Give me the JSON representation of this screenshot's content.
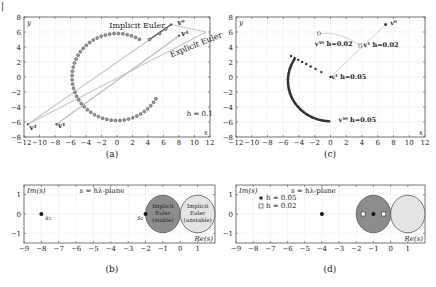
{
  "figure": {
    "corner_mark": "|",
    "captions": [
      "(a)",
      "(b)",
      "(c)",
      "(d)"
    ]
  },
  "chart_data": [
    {
      "id": "a",
      "type": "scatter",
      "title": "",
      "caption": "(a)",
      "xlabel": "x",
      "ylabel": "y",
      "xlim": [
        -12,
        12
      ],
      "ylim": [
        -8,
        8
      ],
      "xticks": [
        -12,
        -10,
        -8,
        -6,
        -4,
        -2,
        0,
        2,
        4,
        6,
        8,
        10,
        12
      ],
      "yticks": [
        -8,
        -6,
        -4,
        -2,
        0,
        2,
        4,
        6,
        8
      ],
      "grid": true,
      "annotations": [
        {
          "text": "Implicit Euler",
          "x": -1.0,
          "y": 6.6
        },
        {
          "text": "Explicit Euler",
          "x": 7.0,
          "y": 2.6,
          "rotate": -22,
          "color": "#aaaaaa"
        },
        {
          "text": "h = 0.1",
          "x": 9.0,
          "y": -5.2
        },
        {
          "text": "v⁰",
          "x": 7.8,
          "y": 7.0
        },
        {
          "text": "v¹",
          "x": 8.3,
          "y": 5.5
        },
        {
          "text": "v³",
          "x": -11.3,
          "y": -7.0
        },
        {
          "text": "v¹",
          "x": -7.6,
          "y": -6.8
        }
      ],
      "series": [
        {
          "name": "Implicit Euler",
          "style": "circles-dark",
          "description": "start at v0=(7,7), straight segment to (4,5), then large arc of radius ~6 around (0,0) ending near (5,-3)",
          "start": [
            7,
            7
          ],
          "link": [
            4.2,
            5.0
          ],
          "arc": {
            "cx": 0.0,
            "cy": 0.0,
            "r": 5.8,
            "theta_start_deg": 60,
            "theta_end_deg": 330,
            "n": 48
          }
        },
        {
          "name": "Explicit Euler",
          "style": "light-lines",
          "points": [
            [
              7,
              7
            ],
            [
              8,
              5.5
            ],
            [
              -11.5,
              -6.3
            ],
            [
              -7.8,
              -6.3
            ],
            [
              11.5,
              6.0
            ]
          ]
        }
      ]
    },
    {
      "id": "c",
      "type": "scatter",
      "caption": "(c)",
      "xlabel": "x",
      "ylabel": "y",
      "xlim": [
        -12,
        12
      ],
      "ylim": [
        -8,
        8
      ],
      "xticks": [
        -12,
        -10,
        -8,
        -6,
        -4,
        -2,
        0,
        2,
        4,
        6,
        8,
        10,
        12
      ],
      "yticks": [
        -8,
        -6,
        -4,
        -2,
        0,
        2,
        4,
        6,
        8
      ],
      "grid": true,
      "annotations": [
        {
          "text": "v⁰",
          "x": 7.6,
          "y": 7.0
        },
        {
          "text": "v⁵⁰ h=0.02",
          "x": -2.0,
          "y": 4.2
        },
        {
          "text": "v¹ h=0.02",
          "x": 4.2,
          "y": 4.0
        },
        {
          "text": "v¹ h=0.05",
          "x": 0.1,
          "y": -0.2
        },
        {
          "text": "v⁵⁰ h=0.05",
          "x": 1.0,
          "y": -6.0
        }
      ],
      "series": [
        {
          "name": "h = 0.05",
          "style": "dots-dark",
          "start": [
            7,
            7
          ],
          "link_to": [
            0,
            0
          ],
          "points_line": {
            "from": [
              0,
              0
            ],
            "to": [
              -5,
              2.8
            ],
            "n": 8
          },
          "arc": {
            "cx": 0.0,
            "cy": -0.5,
            "r": 5.4,
            "theta_start_deg": 148,
            "theta_end_deg": 268,
            "n": 60
          }
        },
        {
          "name": "h = 0.02",
          "style": "squares-light",
          "points": [
            [
              7,
              7
            ],
            [
              3.8,
              4.2
            ],
            [
              -1.5,
              5.8
            ]
          ]
        }
      ]
    },
    {
      "id": "b",
      "type": "scatter",
      "caption": "(b)",
      "xlabel": "Re(s)",
      "ylabel": "Im(s)",
      "title": "s = hλ-plane",
      "xlim": [
        -9,
        2
      ],
      "ylim": [
        -1.5,
        1.5
      ],
      "xticks": [
        -9,
        -8,
        -7,
        -6,
        -5,
        -4,
        -3,
        -2,
        -1,
        0,
        1
      ],
      "yticks": [
        -1,
        0,
        1
      ],
      "grid": true,
      "regions": [
        {
          "label": [
            "Implicit",
            "Euler",
            "(stable)"
          ],
          "cx": -1,
          "cy": 0,
          "r": 1,
          "fill": "#8c8c8c"
        },
        {
          "label": [
            "Implicit",
            "Euler",
            "(unstable)"
          ],
          "cx": 1,
          "cy": 0,
          "r": 1,
          "fill": "#e4e4e4"
        }
      ],
      "points": [
        {
          "label": "s₂",
          "x": -8,
          "y": 0,
          "marker": "dot"
        },
        {
          "label": "s₁",
          "x": -2,
          "y": 0,
          "marker": "dot"
        }
      ]
    },
    {
      "id": "d",
      "type": "scatter",
      "caption": "(d)",
      "xlabel": "Re(s)",
      "ylabel": "Im(s)",
      "title": "s = hλ-plane",
      "xlim": [
        -9,
        2
      ],
      "ylim": [
        -1.5,
        1.5
      ],
      "xticks": [
        -9,
        -8,
        -7,
        -6,
        -5,
        -4,
        -3,
        -2,
        -1,
        0,
        1
      ],
      "yticks": [
        -1,
        0,
        1
      ],
      "grid": true,
      "legend": [
        {
          "label": "h = 0.05",
          "marker": "dot"
        },
        {
          "label": "h = 0.02",
          "marker": "square"
        }
      ],
      "regions": [
        {
          "cx": -1,
          "cy": 0,
          "r": 1,
          "fill": "#8c8c8c"
        },
        {
          "cx": 1,
          "cy": 0,
          "r": 1,
          "fill": "#e4e4e4"
        }
      ],
      "points": [
        {
          "x": -4,
          "y": 0,
          "marker": "dot"
        },
        {
          "x": -1,
          "y": 0,
          "marker": "dot"
        },
        {
          "x": -1.6,
          "y": 0,
          "marker": "square"
        },
        {
          "x": -0.4,
          "y": 0,
          "marker": "square"
        }
      ]
    }
  ]
}
